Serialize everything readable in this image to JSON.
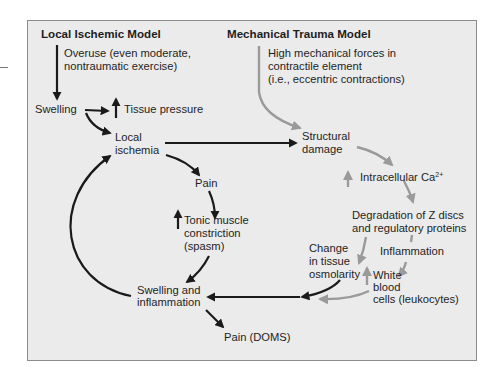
{
  "diagram": {
    "colors": {
      "background": "#ebebeb",
      "border": "#8c8c8c",
      "ischemic_arrow": "#1a1a1a",
      "trauma_arrow": "#9a9a9a"
    },
    "left_model": {
      "title": "Local Ischemic Model",
      "overuse_line1": "Overuse (even moderate,",
      "overuse_line2": "nontraumatic exercise)",
      "swelling": "Swelling",
      "tissue_pressure": "Tissue pressure",
      "local_ischemia_line1": "Local",
      "local_ischemia_line2": "ischemia",
      "pain": "Pain",
      "tonic_line1": "Tonic muscle",
      "tonic_line2": "constriction",
      "tonic_line3": "(spasm)",
      "swelling_inflammation_line1": "Swelling and",
      "swelling_inflammation_line2": "inflammation",
      "pain_doms": "Pain (DOMS)"
    },
    "right_model": {
      "title": "Mechanical Trauma Model",
      "forces_line1": "High mechanical forces in",
      "forces_line2": "contractile element",
      "forces_line3": "(i.e., eccentric contractions)",
      "structural_line1": "Structural",
      "structural_line2": "damage",
      "calcium": "Intracellular Ca",
      "calcium_sup": "2+",
      "degradation_line1": "Degradation of Z discs",
      "degradation_line2": "and regulatory proteins",
      "inflammation": "Inflammation",
      "osmolarity_line1": "Change",
      "osmolarity_line2": "in tissue",
      "osmolarity_line3": "osmolarity",
      "wbc_line1": "White",
      "wbc_line2": "blood",
      "wbc_line3": "cells (leukocytes)"
    },
    "icons": {
      "increase": "up-arrow"
    }
  }
}
